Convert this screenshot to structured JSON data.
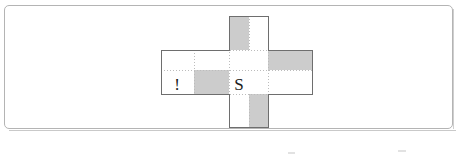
{
  "figure": {
    "frame": {
      "label": "figure-border"
    },
    "labels": {
      "center_cell": "S",
      "left_arm_cell": "!"
    },
    "colors": {
      "shade_gray": "#cccccc",
      "outline": "#6e6e6e",
      "frame_border": "#b4b4b4",
      "background": "#ffffff",
      "grid_dotted": "#bcbcbc",
      "glyph": "#1a1a1a"
    },
    "cross": {
      "arms": [
        {
          "name": "top-arm",
          "shading": "left-half-gray right-half-white"
        },
        {
          "name": "left-arm",
          "shading": "upper-white lower-right-gray",
          "label": "!"
        },
        {
          "name": "center",
          "shading": "white",
          "label": "S"
        },
        {
          "name": "right-arm",
          "shading": "upper-gray lower-white"
        },
        {
          "name": "bottom-arm",
          "shading": "left-half-white right-half-gray"
        }
      ]
    }
  }
}
